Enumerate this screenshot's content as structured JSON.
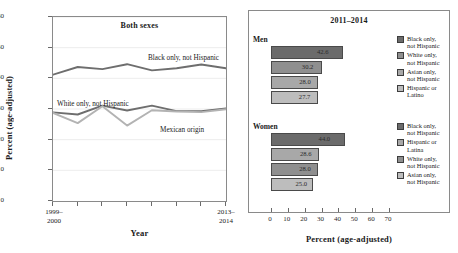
{
  "chart_data": [
    {
      "type": "line",
      "title": "Both sexes",
      "xlabel": "Year",
      "ylabel": "Percent (age-adjusted)",
      "ylim": [
        0,
        60
      ],
      "yticks": [
        0,
        10,
        20,
        30,
        40,
        50,
        60
      ],
      "grid": true,
      "legend_position": "inline-labels",
      "x": [
        "1999-2000",
        "2001-2002",
        "2003-2004",
        "2005-2006",
        "2007-2008",
        "2009-2010",
        "2011-2012",
        "2013-2014"
      ],
      "xtick_labels": [
        "1999–\n2000",
        "",
        "",
        "",
        "",
        "",
        "",
        "2013–\n2014"
      ],
      "series": [
        {
          "name": "Black only, not Hispanic",
          "color": "#6e6e6e",
          "values": [
            41.2,
            43.7,
            43.0,
            44.6,
            42.6,
            43.3,
            44.5,
            43.3
          ]
        },
        {
          "name": "White only, not Hispanic",
          "color": "#6e6e6e",
          "values": [
            28.9,
            28.2,
            31.1,
            29.5,
            31.1,
            29.3,
            29.3,
            30.2
          ]
        },
        {
          "name": "Mexican origin",
          "color": "#b3b3b3",
          "values": [
            28.7,
            25.4,
            30.9,
            24.6,
            29.6,
            29.2,
            29.0,
            29.9
          ]
        }
      ]
    },
    {
      "type": "bar",
      "title": "2011–2014",
      "xlabel": "Percent (age-adjusted)",
      "ylabel": "",
      "xlim": [
        0,
        70
      ],
      "xticks": [
        0,
        10,
        20,
        30,
        40,
        50,
        60,
        70
      ],
      "orientation": "horizontal",
      "grid": false,
      "legend_position": "right",
      "groups": [
        {
          "name": "Men",
          "categories": [
            "Black only, not Hispanic",
            "White only, not Hispanic",
            "Asian only, not Hispanic",
            "Hispanic or Latino"
          ],
          "values": [
            42.6,
            30.2,
            28.0,
            27.7
          ],
          "colors": [
            "#6b6b6b",
            "#8f8f8f",
            "#a8a8a8",
            "#bdbdbd"
          ]
        },
        {
          "name": "Women",
          "categories": [
            "Black only, not Hispanic",
            "Hispanic or Latina",
            "White only, not Hispanic",
            "Asian only, not Hispanic"
          ],
          "values": [
            44.0,
            28.6,
            28.0,
            25.0
          ],
          "colors": [
            "#6b6b6b",
            "#a8a8a8",
            "#8f8f8f",
            "#bdbdbd"
          ]
        }
      ]
    }
  ],
  "left": {
    "title": "Both sexes",
    "y_title": "Percent (age-adjusted)",
    "x_title": "Year",
    "y_ticks": [
      "60",
      "50",
      "40",
      "30",
      "20",
      "10",
      "0"
    ],
    "x_first_line1": "1999–",
    "x_first_line2": "2000",
    "x_last_line1": "2013–",
    "x_last_line2": "2014",
    "series_labels": {
      "black": "Black only, not Hispanic",
      "white": "White only, not Hispanic",
      "mexican": "Mexican origin"
    }
  },
  "right": {
    "title": "2011–2014",
    "x_title": "Percent (age-adjusted)",
    "x_ticks": [
      "0",
      "10",
      "20",
      "30",
      "40",
      "50",
      "60",
      "70"
    ],
    "men_label": "Men",
    "women_label": "Women",
    "men_bars": [
      {
        "value": "42.6",
        "legend": "Black only,\nnot Hispanic"
      },
      {
        "value": "30.2",
        "legend": "White only,\nnot Hispanic"
      },
      {
        "value": "28.0",
        "legend": "Asian only,\nnot Hispanic"
      },
      {
        "value": "27.7",
        "legend": "Hispanic or\nLatino"
      }
    ],
    "women_bars": [
      {
        "value": "44.0",
        "legend": "Black only,\nnot Hispanic"
      },
      {
        "value": "28.6",
        "legend": "Hispanic or\nLatina"
      },
      {
        "value": "28.0",
        "legend": "White only,\nnot Hispanic"
      },
      {
        "value": "25.0",
        "legend": "Asian only,\nnot Hispanic"
      }
    ]
  }
}
